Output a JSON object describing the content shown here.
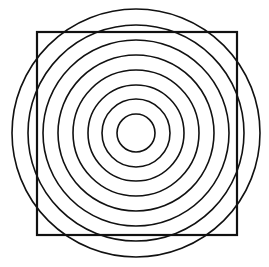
{
  "diagram": {
    "stroke_color": "#111111",
    "background": "#ffffff",
    "center": {
      "x": 136,
      "y": 133
    },
    "circles": [
      {
        "r": 19
      },
      {
        "r": 34
      },
      {
        "r": 48
      },
      {
        "r": 63
      },
      {
        "r": 78
      },
      {
        "r": 93
      },
      {
        "r": 108
      },
      {
        "r": 124
      }
    ],
    "square": {
      "x": 37,
      "y": 32,
      "width": 200,
      "height": 203
    }
  }
}
